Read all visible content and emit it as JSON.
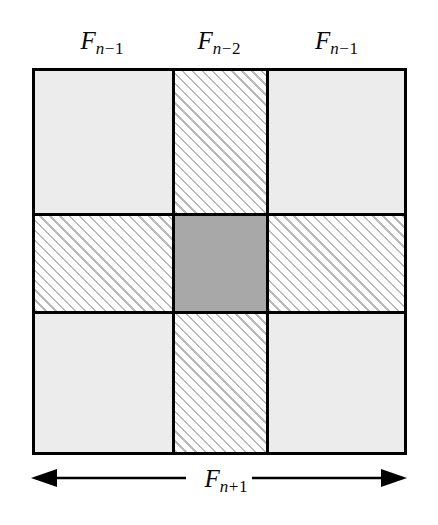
{
  "figure": {
    "type": "fibonacci-square-decomposition-diagram",
    "background_color": "#ffffff",
    "line_color": "#000000"
  },
  "column_labels": [
    {
      "base": "F",
      "op": "−",
      "num": "1",
      "full": "F n−1",
      "column": "left"
    },
    {
      "base": "F",
      "op": "−",
      "num": "2",
      "full": "F n−2",
      "column": "middle"
    },
    {
      "base": "F",
      "op": "−",
      "num": "1",
      "full": "F n−1",
      "column": "right"
    }
  ],
  "dimension": {
    "base": "F",
    "op": "+",
    "num": "1",
    "full": "F n+1",
    "arrow_style": "double-headed",
    "position": "bottom"
  },
  "grid": {
    "rows": 3,
    "columns": 3,
    "column_widths": [
      140,
      94,
      141
    ],
    "row_heights": [
      145,
      98,
      144
    ],
    "cells": [
      {
        "row": 0,
        "col": 0,
        "fill": "light-gray",
        "color": "#ececec"
      },
      {
        "row": 0,
        "col": 1,
        "fill": "diagonal-hatch",
        "color": "#b9b9b9"
      },
      {
        "row": 0,
        "col": 2,
        "fill": "light-gray",
        "color": "#ececec"
      },
      {
        "row": 1,
        "col": 0,
        "fill": "diagonal-hatch",
        "color": "#b9b9b9"
      },
      {
        "row": 1,
        "col": 1,
        "fill": "medium-gray",
        "color": "#a8a8a8"
      },
      {
        "row": 1,
        "col": 2,
        "fill": "diagonal-hatch",
        "color": "#b9b9b9"
      },
      {
        "row": 2,
        "col": 0,
        "fill": "light-gray",
        "color": "#ececec"
      },
      {
        "row": 2,
        "col": 1,
        "fill": "diagonal-hatch",
        "color": "#b9b9b9"
      },
      {
        "row": 2,
        "col": 2,
        "fill": "light-gray",
        "color": "#ececec"
      }
    ]
  }
}
